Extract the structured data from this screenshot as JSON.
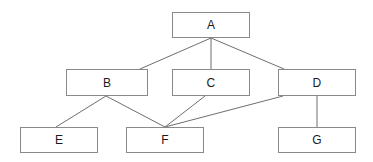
{
  "diagram": {
    "type": "directed-acyclic-graph",
    "background_color": "#ffffff",
    "node_fill_color": "#ffffff",
    "node_border_color": "#8a8a8a",
    "edge_color": "#6e6e6e",
    "label_color": "#1a1a1a",
    "nodes": [
      {
        "id": "A",
        "label": "A",
        "x": 172,
        "y": 12,
        "width": 78,
        "height": 26
      },
      {
        "id": "B",
        "label": "B",
        "x": 66,
        "y": 69,
        "width": 82,
        "height": 27
      },
      {
        "id": "C",
        "label": "C",
        "x": 172,
        "y": 69,
        "width": 78,
        "height": 27
      },
      {
        "id": "D",
        "label": "D",
        "x": 278,
        "y": 69,
        "width": 78,
        "height": 27
      },
      {
        "id": "E",
        "label": "E",
        "x": 20,
        "y": 127,
        "width": 78,
        "height": 26
      },
      {
        "id": "F",
        "label": "F",
        "x": 126,
        "y": 127,
        "width": 78,
        "height": 26
      },
      {
        "id": "G",
        "label": "G",
        "x": 278,
        "y": 127,
        "width": 78,
        "height": 26
      }
    ],
    "edges": [
      {
        "from": "A",
        "to": "B",
        "x1": 211,
        "y1": 38,
        "x2": 140,
        "y2": 69
      },
      {
        "from": "A",
        "to": "C",
        "x1": 211,
        "y1": 38,
        "x2": 211,
        "y2": 69
      },
      {
        "from": "A",
        "to": "D",
        "x1": 211,
        "y1": 38,
        "x2": 284,
        "y2": 69
      },
      {
        "from": "B",
        "to": "E",
        "x1": 106,
        "y1": 96,
        "x2": 56,
        "y2": 127
      },
      {
        "from": "B",
        "to": "F",
        "x1": 106,
        "y1": 96,
        "x2": 165,
        "y2": 127
      },
      {
        "from": "C",
        "to": "F",
        "x1": 205,
        "y1": 96,
        "x2": 165,
        "y2": 127
      },
      {
        "from": "D",
        "to": "F",
        "x1": 283,
        "y1": 96,
        "x2": 165,
        "y2": 127
      },
      {
        "from": "D",
        "to": "G",
        "x1": 317,
        "y1": 96,
        "x2": 317,
        "y2": 127
      }
    ]
  }
}
